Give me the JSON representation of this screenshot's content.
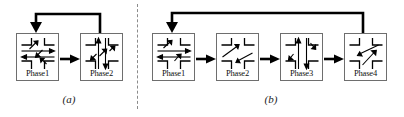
{
  "figure": {
    "type": "diagram",
    "stroke_color": "#000000",
    "box_border_color": "#6e6e6e",
    "divider_color": "#8b8b8b",
    "background": "#ffffff"
  },
  "panels": [
    {
      "id": "a",
      "caption": "(a)",
      "phase_count": 2,
      "feedback_arrow": {
        "name": "feedback-loop-arrow",
        "from_phase": "Phase2",
        "to_phase": "Phase1",
        "direction": "right-to-left-over-top"
      },
      "phases": [
        {
          "label": "Phase1",
          "movements": [
            "northbound-left",
            "southbound-left",
            "eastbound-through",
            "westbound-through"
          ]
        },
        {
          "label": "Phase2",
          "movements": [
            "northbound-through",
            "southbound-through",
            "eastbound-left",
            "westbound-left"
          ]
        }
      ],
      "forward_arrows": [
        {
          "from": "Phase1",
          "to": "Phase2"
        }
      ]
    },
    {
      "id": "b",
      "caption": "(b)",
      "phase_count": 4,
      "feedback_arrow": {
        "name": "feedback-loop-arrow",
        "from_phase": "Phase4",
        "to_phase": "Phase1",
        "direction": "right-to-left-over-top"
      },
      "phases": [
        {
          "label": "Phase1",
          "movements": [
            "eastbound-through",
            "westbound-through",
            "northbound-left"
          ]
        },
        {
          "label": "Phase2",
          "movements": [
            "northbound-left",
            "southbound-left"
          ]
        },
        {
          "label": "Phase3",
          "movements": [
            "northbound-through",
            "southbound-through"
          ]
        },
        {
          "label": "Phase4",
          "movements": [
            "eastbound-left",
            "westbound-left"
          ]
        }
      ],
      "forward_arrows": [
        {
          "from": "Phase1",
          "to": "Phase2"
        },
        {
          "from": "Phase2",
          "to": "Phase3"
        },
        {
          "from": "Phase3",
          "to": "Phase4"
        }
      ]
    }
  ]
}
